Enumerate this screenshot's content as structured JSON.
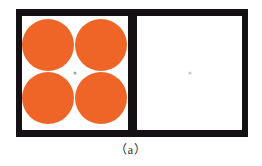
{
  "figure": {
    "caption": "（a）",
    "frame": {
      "border_color": "#141014",
      "background_color": "#ffffff"
    },
    "panels": [
      {
        "id": "left",
        "name": "four-circle-stimulus-panel",
        "background_color": "#ffffff",
        "circle_color": "#EF6528",
        "circle_count": 4,
        "circle_layout": "2x2",
        "fixation_dot": {
          "present": true,
          "color": "#9aa7b4",
          "label": "fixation-dot"
        },
        "circles": [
          {
            "position": "top-left"
          },
          {
            "position": "top-right"
          },
          {
            "position": "bottom-left"
          },
          {
            "position": "bottom-right"
          }
        ]
      },
      {
        "id": "right",
        "name": "blank-stimulus-panel",
        "background_color": "#ffffff",
        "circle_count": 0,
        "fixation_dot": {
          "present": true,
          "color": "#c3ccd6",
          "label": "fixation-dot"
        }
      }
    ]
  }
}
